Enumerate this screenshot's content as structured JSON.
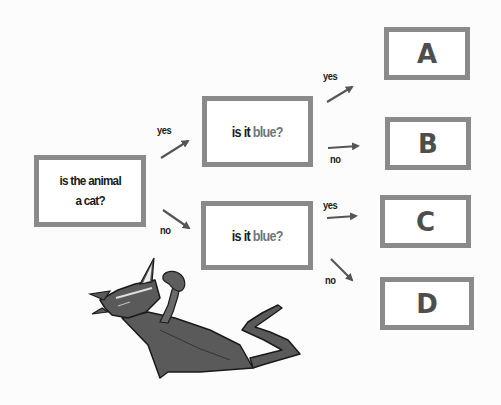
{
  "diagram": {
    "type": "decision-tree",
    "root": {
      "line1": "is the animal",
      "line2": "a cat?"
    },
    "questions": [
      {
        "prefix": "is it ",
        "highlight": "blue?"
      },
      {
        "prefix": "is it ",
        "highlight": "blue?"
      }
    ],
    "leaves": [
      "A",
      "B",
      "C",
      "D"
    ],
    "edge_labels": {
      "root_yes": "yes",
      "root_no": "no",
      "q1_yes": "yes",
      "q1_no": "no",
      "q2_yes": "yes",
      "q2_no": "no"
    },
    "edges": [
      {
        "from": "root",
        "to": "q1",
        "label": "yes"
      },
      {
        "from": "root",
        "to": "q2",
        "label": "no"
      },
      {
        "from": "q1",
        "to": "A",
        "label": "yes"
      },
      {
        "from": "q1",
        "to": "B",
        "label": "no"
      },
      {
        "from": "q2",
        "to": "C",
        "label": "yes"
      },
      {
        "from": "q2",
        "to": "D",
        "label": "no"
      }
    ],
    "illustration": "cat-icon",
    "colors": {
      "box_border": "#8a8a8a",
      "text_dark": "#1a1a1a",
      "text_blue_word": "#6e7780",
      "leaf_letter": "#4e4e4e",
      "arrow": "#555555",
      "cat_body": "#5a5a5a"
    }
  }
}
